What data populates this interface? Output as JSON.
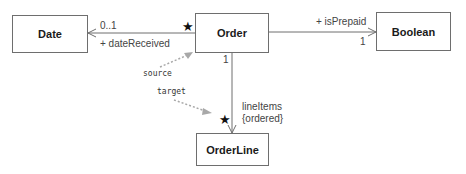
{
  "classes": {
    "date": "Date",
    "order": "Order",
    "boolean": "Boolean",
    "orderline": "OrderLine"
  },
  "associations": {
    "order_date": {
      "role": "+ dateReceived",
      "target_multiplicity": "0..1",
      "source_multiplicity": "★"
    },
    "order_boolean": {
      "role": "+ isPrepaid",
      "target_multiplicity": "1"
    },
    "order_orderline": {
      "role": "lineItems",
      "constraint": "{ordered}",
      "source_multiplicity": "1",
      "target_multiplicity": "★"
    }
  },
  "annotations": {
    "source": "source",
    "target": "target"
  },
  "colors": {
    "line": "#6e6e6e",
    "annotation_arrow": "#a8a8a8"
  }
}
